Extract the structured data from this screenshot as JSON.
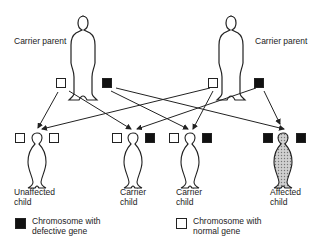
{
  "parents": {
    "left": {
      "label": "Carrier parent",
      "chromosomes": [
        "normal",
        "defective"
      ]
    },
    "right": {
      "label": "Carrier parent",
      "chromosomes": [
        "normal",
        "defective"
      ]
    }
  },
  "children": [
    {
      "label_line1": "Unaffected",
      "label_line2": "child",
      "chromosomes": [
        "normal",
        "normal"
      ],
      "shaded": false
    },
    {
      "label_line1": "Carrier",
      "label_line2": "child",
      "chromosomes": [
        "normal",
        "defective"
      ],
      "shaded": false
    },
    {
      "label_line1": "Carrier",
      "label_line2": "child",
      "chromosomes": [
        "normal",
        "defective"
      ],
      "shaded": false
    },
    {
      "label_line1": "Affected",
      "label_line2": "child",
      "chromosomes": [
        "defective",
        "defective"
      ],
      "shaded": true
    }
  ],
  "legend": {
    "defective": {
      "line1": "Chromosome with",
      "line2": "defective gene"
    },
    "normal": {
      "line1": "Chromosome with",
      "line2": "normal gene"
    }
  },
  "colors": {
    "defective": "#111111",
    "normal": "#ffffff",
    "line": "#222222",
    "affected_fill": "#bdbdbd"
  }
}
